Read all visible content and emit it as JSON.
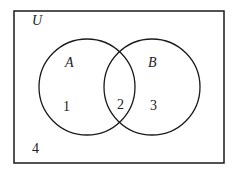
{
  "diagram": {
    "type": "venn",
    "universe_label": "U",
    "sets": [
      {
        "name": "A",
        "cx": 87,
        "cy": 87,
        "r": 48
      },
      {
        "name": "B",
        "cx": 152,
        "cy": 87,
        "r": 48
      }
    ],
    "regions": [
      {
        "id": "A_only",
        "label": "1"
      },
      {
        "id": "A_and_B",
        "label": "2"
      },
      {
        "id": "B_only",
        "label": "3"
      },
      {
        "id": "outside",
        "label": "4"
      }
    ],
    "colors": {
      "stroke": "#1a1a1a",
      "text": "#222222",
      "background": "#ffffff"
    }
  }
}
